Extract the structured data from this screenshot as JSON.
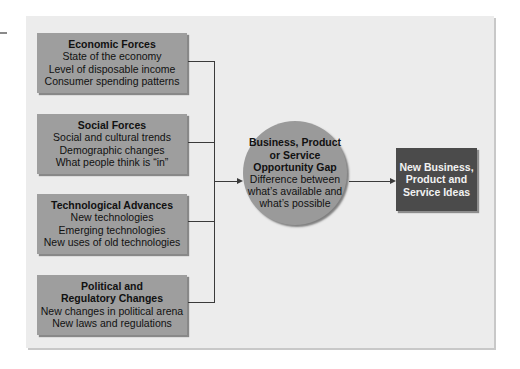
{
  "diagram": {
    "forces": [
      {
        "title": "Economic Forces",
        "items": [
          "State of the economy",
          "Level of disposable income",
          "Consumer spending patterns"
        ]
      },
      {
        "title": "Social Forces",
        "items": [
          "Social and cultural trends",
          "Demographic changes",
          "What people think is “in”"
        ]
      },
      {
        "title": "Technological Advances",
        "items": [
          "New technologies",
          "Emerging technologies",
          "New uses of old technologies"
        ]
      },
      {
        "title_lines": [
          "Political and",
          "Regulatory Changes"
        ],
        "items": [
          "New changes in political arena",
          "New laws and regulations"
        ]
      }
    ],
    "gap": {
      "title_lines": [
        "Business, Product",
        "or Service",
        "Opportunity Gap"
      ],
      "desc_lines": [
        "Difference between",
        "what’s available and",
        "what’s possible"
      ]
    },
    "result": {
      "lines": [
        "New Business,",
        "Product and",
        "Service Ideas"
      ]
    },
    "colors": {
      "frame": "#ececec",
      "force_box": "#9e9e9e",
      "circle": "#9a9a9a",
      "result_box": "#4b4b4b",
      "connector": "#3a3a3a"
    }
  }
}
